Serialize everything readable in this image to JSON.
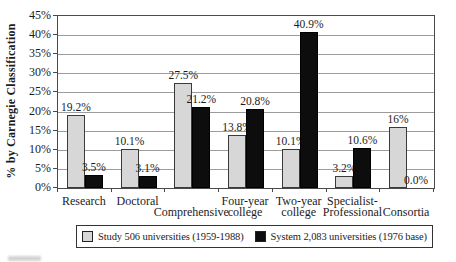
{
  "chart_data": {
    "type": "bar",
    "title": "",
    "xlabel": "",
    "ylabel": "% by Carnegie Classification",
    "ylim": [
      0,
      45
    ],
    "ytick_step": 5,
    "ytick_labels": [
      "0%",
      "5%",
      "10%",
      "15%",
      "20%",
      "25%",
      "30%",
      "35%",
      "40%",
      "45%"
    ],
    "grid": true,
    "legend_position": "bottom",
    "categories": [
      "Research",
      "Doctoral",
      "Comprehensive",
      "Four-year college",
      "Two-year college",
      "Specialist-Professional",
      "Consortia"
    ],
    "category_display": [
      {
        "lines": [
          "Research"
        ],
        "row": 0
      },
      {
        "lines": [
          "Doctoral"
        ],
        "row": 0
      },
      {
        "lines": [
          "Comprehensive"
        ],
        "row": 1
      },
      {
        "lines": [
          "Four-year",
          "college"
        ],
        "row": 0
      },
      {
        "lines": [
          "Two-year",
          "college"
        ],
        "row": 0
      },
      {
        "lines": [
          "Specialist-",
          "Professional"
        ],
        "row": 0
      },
      {
        "lines": [
          "Consortia"
        ],
        "row": 1
      }
    ],
    "series": [
      {
        "name": "Study 506 universities (1959-1988)",
        "color": "#d7d7d7",
        "border_color": "#3a3a3a",
        "values": [
          19.2,
          10.1,
          27.5,
          13.8,
          10.1,
          3.2,
          16
        ],
        "value_labels": [
          "19.2%",
          "10.1%",
          "27.5%",
          "13.8%",
          "10.1%",
          "3.2%",
          "16%"
        ]
      },
      {
        "name": "System 2,083 universities (1976 base)",
        "color": "#0d0d0d",
        "border_color": "#000000",
        "values": [
          3.5,
          3.1,
          21.2,
          20.8,
          40.9,
          10.6,
          0.0
        ],
        "value_labels": [
          "3.5%",
          "3.1%",
          "21.2%",
          "20.8%",
          "40.9%",
          "10.6%",
          "0.0%"
        ]
      }
    ]
  }
}
